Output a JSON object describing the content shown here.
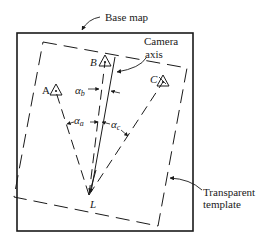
{
  "diagram": {
    "labels": {
      "base_map": "Base map",
      "camera_axis_line1": "Camera",
      "camera_axis_line2": "axis",
      "transparent_template_line1": "Transparent",
      "transparent_template_line2": "template",
      "point_a": "A",
      "point_b": "B",
      "point_c": "C",
      "point_l": "L",
      "alpha_a": "α",
      "alpha_a_sub": "a",
      "alpha_b": "α",
      "alpha_b_sub": "b",
      "alpha_c": "α",
      "alpha_c_sub": "c"
    },
    "colors": {
      "stroke": "#1a1a1a",
      "background": "#ffffff"
    }
  }
}
